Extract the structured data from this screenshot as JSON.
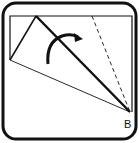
{
  "diagram": {
    "type": "origami-fold-step",
    "point_label": "B",
    "colors": {
      "stroke": "#111111",
      "background": "#ffffff"
    }
  }
}
